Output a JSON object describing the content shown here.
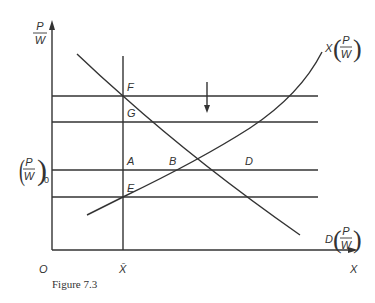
{
  "figure": {
    "caption": "Figure 7.3",
    "axes": {
      "y_label_num": "P",
      "y_label_den": "W",
      "x_label": "X",
      "origin": "O",
      "x_bar": "X̄"
    },
    "y_tick_label": {
      "num": "P",
      "den": "W",
      "subscript": "0"
    },
    "points": {
      "F": "F",
      "G": "G",
      "A": "A",
      "B": "B",
      "D": "D",
      "E": "E"
    },
    "curves": {
      "supply": {
        "prefix": "X",
        "num": "P",
        "den": "W"
      },
      "demand": {
        "prefix": "D",
        "num": "P",
        "den": "W"
      }
    },
    "arrow_direction": "down",
    "colors": {
      "line": "#333333",
      "background": "#ffffff"
    }
  }
}
